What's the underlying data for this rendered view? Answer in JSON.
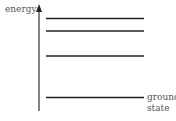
{
  "diagram": {
    "axis_label": "energy",
    "levels": [
      {
        "name": "level-4",
        "y": 18.5
      },
      {
        "name": "level-3",
        "y": 31
      },
      {
        "name": "level-2",
        "y": 56
      },
      {
        "name": "ground",
        "y": 97.5
      }
    ],
    "ground_label_line1": "ground",
    "ground_label_line2": "state",
    "line_color": "#222222",
    "text_color": "#555555"
  }
}
